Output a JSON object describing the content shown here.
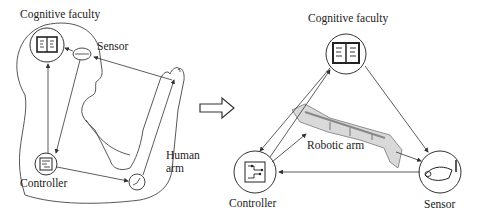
{
  "left_panel": {
    "labels": {
      "cognitive": "Cognitive faculty",
      "sensor": "Sensor",
      "human_arm_line1": "Human",
      "human_arm_line2": "arm",
      "controller": "Controller"
    }
  },
  "transition": {
    "arrow": "right-hollow-arrow"
  },
  "right_panel": {
    "labels": {
      "cognitive": "Cognitive faculty",
      "robotic_arm": "Robotic arm",
      "controller": "Controller",
      "sensor": "Sensor"
    }
  },
  "colors": {
    "stroke": "#333333",
    "background": "#ffffff"
  }
}
